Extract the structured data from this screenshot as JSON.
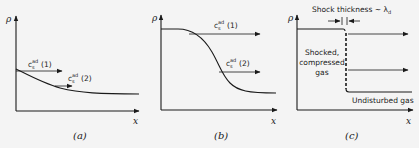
{
  "figure": {
    "panels": [
      {
        "id": "a",
        "caption": "(a)",
        "y_axis_label": "ρ",
        "x_axis_label": "x",
        "curve": "gently decreasing density profile",
        "arrows": [
          {
            "label_main": "c",
            "label_sup": "ad",
            "label_sub": "s",
            "label_tag": "(1)"
          },
          {
            "label_main": "c",
            "label_sup": "ad",
            "label_sub": "s",
            "label_tag": "(2)"
          }
        ]
      },
      {
        "id": "b",
        "caption": "(b)",
        "y_axis_label": "ρ",
        "x_axis_label": "x",
        "curve": "steepening S-shaped density profile",
        "arrows": [
          {
            "label_main": "c",
            "label_sup": "ad",
            "label_sub": "s",
            "label_tag": "(1)"
          },
          {
            "label_main": "c",
            "label_sup": "ad",
            "label_sub": "s",
            "label_tag": "(2)"
          }
        ]
      },
      {
        "id": "c",
        "caption": "(c)",
        "y_axis_label": "ρ",
        "x_axis_label": "x",
        "curve": "step (shock) density profile",
        "shock_thickness_label": "Shock thickness ~ λ",
        "shock_thickness_sub": "d",
        "left_region_label": [
          "Shocked,",
          "compressed",
          "gas"
        ],
        "right_region_label": "Undisturbed gas"
      }
    ]
  }
}
